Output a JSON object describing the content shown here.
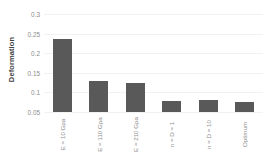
{
  "chart_data": {
    "type": "bar",
    "title": "",
    "xlabel": "",
    "ylabel": "Deformation",
    "ylim": [
      0.05,
      0.3
    ],
    "yticks": [
      "0.3",
      "0.25",
      "0.2",
      "0.15",
      "0.1",
      "0.05"
    ],
    "ytick_values": [
      0.3,
      0.25,
      0.2,
      0.15,
      0.1,
      0.05
    ],
    "grid": true,
    "legend": "none",
    "bar_color": "#595959",
    "gridline_color": "#f2f2f2",
    "tick_label_color": "#8c8c8c",
    "axis_title_color": "#3f3f3f",
    "categories": [
      "E = 10 Gpa",
      "E = 110 Gpa",
      "E = 210 Gpa",
      "n = D = 1",
      "n = D = 10",
      "Optimum"
    ],
    "values": [
      0.235,
      0.13,
      0.123,
      0.078,
      0.081,
      0.076
    ]
  }
}
